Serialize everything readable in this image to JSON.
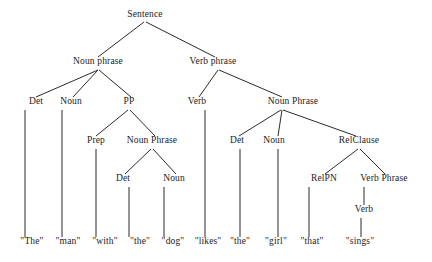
{
  "figure": {
    "kind": "syntax-parse-tree",
    "sentence": "The man with the dog likes the girl that sings",
    "background_color": "#ffffff",
    "line_color": "#2b2b2b",
    "text_color": "#1b1b1b"
  },
  "nodes": [
    {
      "id": "sentence",
      "label": "Sentence",
      "x": 145,
      "y": 18
    },
    {
      "id": "np-subject",
      "label": "Noun phrase",
      "x": 98,
      "y": 65
    },
    {
      "id": "vp-main",
      "label": "Verb phrase",
      "x": 213,
      "y": 65
    },
    {
      "id": "det-1",
      "label": "Det",
      "x": 36,
      "y": 105
    },
    {
      "id": "noun-1",
      "label": "Noun",
      "x": 71,
      "y": 105
    },
    {
      "id": "pp",
      "label": "PP",
      "x": 129,
      "y": 105
    },
    {
      "id": "verb-1",
      "label": "Verb",
      "x": 197,
      "y": 105
    },
    {
      "id": "np-object",
      "label": "Noun Phrase",
      "x": 293,
      "y": 105
    },
    {
      "id": "prep",
      "label": "Prep",
      "x": 96,
      "y": 144
    },
    {
      "id": "np-pp",
      "label": "Noun Phrase",
      "x": 152,
      "y": 144
    },
    {
      "id": "det-2",
      "label": "Det",
      "x": 237,
      "y": 144
    },
    {
      "id": "noun-2",
      "label": "Noun",
      "x": 274,
      "y": 144
    },
    {
      "id": "relclause",
      "label": "RelClause",
      "x": 359,
      "y": 144
    },
    {
      "id": "det-3",
      "label": "Det",
      "x": 123,
      "y": 182
    },
    {
      "id": "noun-3",
      "label": "Noun",
      "x": 174,
      "y": 182
    },
    {
      "id": "relpn",
      "label": "RelPN",
      "x": 324,
      "y": 182
    },
    {
      "id": "vp-rel",
      "label": "Verb Phrase",
      "x": 384,
      "y": 182
    },
    {
      "id": "verb-2",
      "label": "Verb",
      "x": 364,
      "y": 213
    }
  ],
  "leaves": [
    {
      "id": "word-the-1",
      "label": "\"The\"",
      "x": 32,
      "y": 245
    },
    {
      "id": "word-man",
      "label": "\"man\"",
      "x": 68,
      "y": 245
    },
    {
      "id": "word-with",
      "label": "\"with\"",
      "x": 105,
      "y": 245
    },
    {
      "id": "word-the-2",
      "label": "\"the\"",
      "x": 140,
      "y": 245
    },
    {
      "id": "word-dog",
      "label": "\"dog\"",
      "x": 173,
      "y": 245
    },
    {
      "id": "word-likes",
      "label": "\"likes\"",
      "x": 208,
      "y": 245
    },
    {
      "id": "word-the-3",
      "label": "\"the\"",
      "x": 240,
      "y": 245
    },
    {
      "id": "word-girl",
      "label": "\"girl\"",
      "x": 276,
      "y": 245
    },
    {
      "id": "word-that",
      "label": "\"that\"",
      "x": 312,
      "y": 245
    },
    {
      "id": "word-sings",
      "label": "\"sings\"",
      "x": 360,
      "y": 245
    }
  ],
  "edges": [
    {
      "from": "sentence",
      "to": "np-subject",
      "x1": 144,
      "y1": 22,
      "x2": 98,
      "y2": 57
    },
    {
      "from": "sentence",
      "to": "vp-main",
      "x1": 146,
      "y1": 22,
      "x2": 215,
      "y2": 57
    },
    {
      "from": "np-subject",
      "to": "det-1",
      "x1": 98,
      "y1": 70,
      "x2": 36,
      "y2": 97
    },
    {
      "from": "np-subject",
      "to": "noun-1",
      "x1": 98,
      "y1": 70,
      "x2": 73,
      "y2": 97
    },
    {
      "from": "np-subject",
      "to": "pp",
      "x1": 99,
      "y1": 70,
      "x2": 131,
      "y2": 97
    },
    {
      "from": "vp-main",
      "to": "verb-1",
      "x1": 218,
      "y1": 70,
      "x2": 199,
      "y2": 97
    },
    {
      "from": "vp-main",
      "to": "np-object",
      "x1": 219,
      "y1": 70,
      "x2": 282,
      "y2": 97
    },
    {
      "from": "det-1",
      "to": "word-the-1",
      "x1": 25,
      "y1": 110,
      "x2": 25,
      "y2": 237
    },
    {
      "from": "noun-1",
      "to": "word-man",
      "x1": 62,
      "y1": 110,
      "x2": 62,
      "y2": 237
    },
    {
      "from": "pp",
      "to": "prep",
      "x1": 128,
      "y1": 110,
      "x2": 96,
      "y2": 136
    },
    {
      "from": "pp",
      "to": "np-pp",
      "x1": 130,
      "y1": 110,
      "x2": 155,
      "y2": 136
    },
    {
      "from": "prep",
      "to": "word-with",
      "x1": 96,
      "y1": 149,
      "x2": 96,
      "y2": 237
    },
    {
      "from": "np-pp",
      "to": "det-3",
      "x1": 151,
      "y1": 149,
      "x2": 125,
      "y2": 174
    },
    {
      "from": "np-pp",
      "to": "noun-3",
      "x1": 153,
      "y1": 149,
      "x2": 176,
      "y2": 174
    },
    {
      "from": "det-3",
      "to": "word-the-2",
      "x1": 129,
      "y1": 187,
      "x2": 129,
      "y2": 237
    },
    {
      "from": "noun-3",
      "to": "word-dog",
      "x1": 164,
      "y1": 187,
      "x2": 164,
      "y2": 237
    },
    {
      "from": "verb-1",
      "to": "word-likes",
      "x1": 205,
      "y1": 110,
      "x2": 205,
      "y2": 237
    },
    {
      "from": "np-object",
      "to": "det-2",
      "x1": 281,
      "y1": 110,
      "x2": 239,
      "y2": 136
    },
    {
      "from": "np-object",
      "to": "noun-2",
      "x1": 282,
      "y1": 110,
      "x2": 278,
      "y2": 136
    },
    {
      "from": "np-object",
      "to": "relclause",
      "x1": 283,
      "y1": 110,
      "x2": 356,
      "y2": 136
    },
    {
      "from": "det-2",
      "to": "word-the-3",
      "x1": 240,
      "y1": 149,
      "x2": 240,
      "y2": 237
    },
    {
      "from": "noun-2",
      "to": "word-girl",
      "x1": 278,
      "y1": 149,
      "x2": 278,
      "y2": 237
    },
    {
      "from": "relclause",
      "to": "relpn",
      "x1": 358,
      "y1": 149,
      "x2": 325,
      "y2": 174
    },
    {
      "from": "relclause",
      "to": "vp-rel",
      "x1": 360,
      "y1": 149,
      "x2": 385,
      "y2": 174
    },
    {
      "from": "relpn",
      "to": "word-that",
      "x1": 309,
      "y1": 187,
      "x2": 309,
      "y2": 237
    },
    {
      "from": "vp-rel",
      "to": "verb-2",
      "x1": 364,
      "y1": 187,
      "x2": 364,
      "y2": 205
    },
    {
      "from": "verb-2",
      "to": "word-sings",
      "x1": 361,
      "y1": 218,
      "x2": 361,
      "y2": 237
    }
  ]
}
